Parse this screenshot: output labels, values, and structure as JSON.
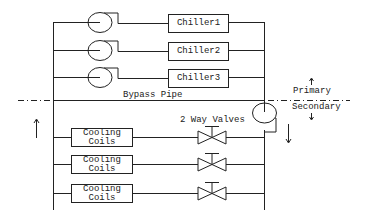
{
  "diagram": {
    "chillers": [
      {
        "label": "Chiller1"
      },
      {
        "label": "Chiller2"
      },
      {
        "label": "Chiller3"
      }
    ],
    "bypass_label": "Bypass Pipe",
    "valves_label": "2 Way Valves",
    "zones": {
      "primary": "Primary",
      "secondary": "Secondary"
    },
    "coils": [
      {
        "line1": "Cooling",
        "line2": "Coils"
      },
      {
        "line1": "Cooling",
        "line2": "Coils"
      },
      {
        "line1": "Cooling",
        "line2": "Coils"
      }
    ],
    "colors": {
      "line": "#222222",
      "background": "#ffffff"
    }
  }
}
